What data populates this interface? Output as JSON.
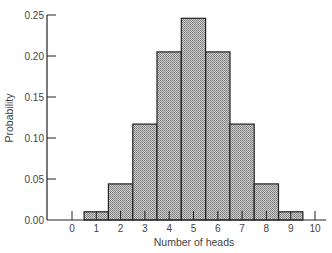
{
  "chart_data": {
    "type": "bar",
    "title": "",
    "xlabel": "Number of heads",
    "ylabel": "Probability",
    "categories": [
      "0",
      "1",
      "2",
      "3",
      "4",
      "5",
      "6",
      "7",
      "8",
      "9",
      "10"
    ],
    "values": [
      0.001,
      0.01,
      0.044,
      0.117,
      0.205,
      0.246,
      0.205,
      0.117,
      0.044,
      0.01,
      0.001
    ],
    "ylim": [
      0,
      0.25
    ],
    "yticks": [
      "0.00",
      "0.05",
      "0.10",
      "0.15",
      "0.20",
      "0.25"
    ],
    "xticks": [
      "0",
      "1",
      "2",
      "3",
      "4",
      "5",
      "6",
      "7",
      "8",
      "9",
      "10"
    ],
    "grid": false,
    "legend": null,
    "bar_fill": "#b8b8b8",
    "bar_edge": "#222222"
  },
  "axes": {
    "x_title": "Number of heads",
    "y_title": "Probability"
  }
}
